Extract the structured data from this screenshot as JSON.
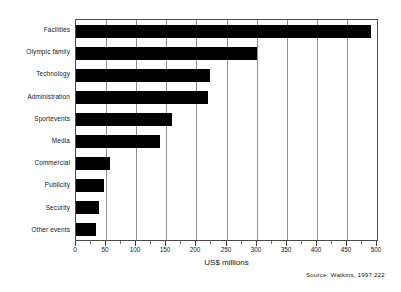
{
  "chart_data": {
    "type": "bar",
    "orientation": "horizontal",
    "title": "",
    "subtitle": "",
    "xlabel": "US$ millions",
    "ylabel": "",
    "xlim": [
      0,
      500
    ],
    "ylim": null,
    "grid": true,
    "legend": null,
    "legend_position": "none",
    "source_note": "Source: Watkins, 1997:222",
    "bar_color": "#000000",
    "axis_color": "#4a4a4a",
    "gridline_color": "#8e8e8e",
    "xticks": [
      0,
      50,
      100,
      150,
      200,
      250,
      300,
      350,
      400,
      450,
      500
    ],
    "xtick_labels": [
      "0",
      "50",
      "100",
      "150",
      "200",
      "250",
      "300",
      "350",
      "400",
      "450",
      "500"
    ],
    "categories": [
      "Facilities",
      "Olympic family",
      "Technology",
      "Administration",
      "Sportevents",
      "Media",
      "Commercial",
      "Publicity",
      "Security",
      "Other events"
    ],
    "values": [
      490,
      300,
      222,
      220,
      160,
      140,
      57,
      46,
      38,
      33
    ]
  }
}
